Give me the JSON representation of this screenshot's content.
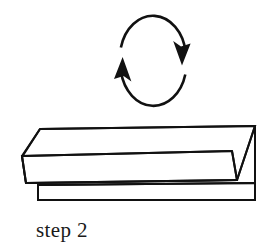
{
  "figure": {
    "kind": "origami-instruction-diagram",
    "caption": "step 2",
    "background_color": "#ffffff",
    "ink_color": "#111111",
    "paper_fill_color": "#ffffff",
    "line_width_px": 2
  },
  "rotation_arrow": {
    "name": "flip-over-arrow",
    "description": "closed oval arrow indicating turn the model over",
    "direction": "counterclockwise",
    "ellipse_center_x": 153,
    "ellipse_center_y": 62,
    "ellipse_radius_x": 33,
    "ellipse_radius_y": 42,
    "head_top_right": {
      "tip_x": 182,
      "tip_y": 59,
      "points": "down"
    },
    "head_bottom_left": {
      "tip_x": 122,
      "tip_y": 61,
      "points": "up"
    },
    "arc_right_start_deg": 200,
    "arc_right_end_deg": 357,
    "arc_left_start_deg": 20,
    "arc_left_end_deg": 177
  },
  "paper_model": {
    "name": "folded-paper-strip",
    "faces": [
      {
        "id": "top-face",
        "label": "upper sloping face",
        "points": "40,129 255,126 255,174 224,174 38,170"
      },
      {
        "id": "front-band-face",
        "label": "front narrow band",
        "points": "22,156 232,151 224,179 26,183"
      },
      {
        "id": "bottom-layer-face",
        "label": "lower hidden layer",
        "points": "38,185 255,183 255,200 38,200"
      }
    ],
    "crease_lines": [
      {
        "id": "left-slant-crease",
        "label": "left diagonal edge of top face",
        "points": "40,129 22,157"
      },
      {
        "id": "right-diagonal-crease",
        "label": "right diagonal fold at open end",
        "points": "255,126 237,180"
      },
      {
        "id": "inner-vee-crease",
        "label": "inner V fold near right end",
        "points": "232,151 237,180"
      },
      {
        "id": "long-top-edge",
        "label": "long top edge of strip",
        "points": "40,129 255,126"
      },
      {
        "id": "long-middle-edge",
        "label": "long middle edge where band meets top face",
        "points": "22,156 232,151"
      },
      {
        "id": "long-lower-edge",
        "label": "long lower edge of band",
        "points": "26,183 237,180"
      },
      {
        "id": "bottom-layer-top-edge",
        "label": "top edge of lower layer",
        "points": "38,185 255,183"
      },
      {
        "id": "bottom-layer-bottom-edge",
        "label": "bottom edge of lower layer",
        "points": "38,200 255,200"
      },
      {
        "id": "bottom-layer-left-edge",
        "label": "left edge of lower layer",
        "points": "38,185 38,200"
      },
      {
        "id": "right-vertical-edge",
        "label": "right vertical edge of model",
        "points": "255,126 255,200"
      },
      {
        "id": "band-left-edge",
        "label": "left edge of front band",
        "points": "22,156 26,183"
      }
    ]
  }
}
